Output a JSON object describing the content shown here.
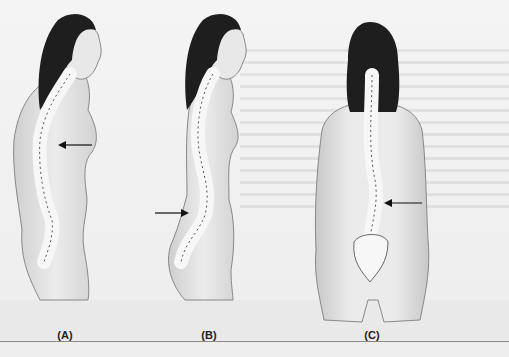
{
  "figure": {
    "panels": [
      {
        "label": "(A)",
        "view": "side",
        "arrow": "thoracic",
        "center_x": 65
      },
      {
        "label": "(B)",
        "view": "side",
        "arrow": "lumbar",
        "center_x": 209
      },
      {
        "label": "(C)",
        "view": "back",
        "arrow": "lumbar-lateral",
        "center_x": 372
      }
    ]
  },
  "colors": {
    "background": "#f2f2f2",
    "skin": "#e6e6e6",
    "skin_shade": "#bdbdbd",
    "hair": "#1e1e1e",
    "bone": "#f7f7f7",
    "outline": "#555555",
    "arrow": "#111111",
    "divider": "#8a8a8a"
  }
}
